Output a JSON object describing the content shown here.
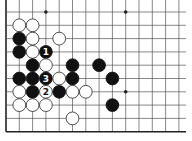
{
  "board": {
    "title": "Go problem diagram",
    "grid": {
      "columns": 14,
      "rows": 10,
      "origin_x": 6,
      "origin_y": 12,
      "spacing": 13.3,
      "left_edge": true,
      "bottom_edge": true,
      "top_edge": false,
      "right_edge": false
    },
    "colors": {
      "background": "#ffffff",
      "line": "#555555",
      "edge": "#222222",
      "black_stone": "#111111",
      "white_stone": "#ffffff",
      "white_stroke": "#222222"
    },
    "hoshi": [
      {
        "col": 3,
        "row": 0
      },
      {
        "col": 9,
        "row": 0
      },
      {
        "col": 9,
        "row": 6
      }
    ],
    "stones": [
      {
        "col": 1,
        "row": 1,
        "color": "white",
        "label": ""
      },
      {
        "col": 2,
        "row": 1,
        "color": "white",
        "label": ""
      },
      {
        "col": 1,
        "row": 2,
        "color": "black",
        "label": ""
      },
      {
        "col": 2,
        "row": 2,
        "color": "white",
        "label": ""
      },
      {
        "col": 4,
        "row": 2,
        "color": "white",
        "label": ""
      },
      {
        "col": 1,
        "row": 3,
        "color": "black",
        "label": ""
      },
      {
        "col": 2,
        "row": 3,
        "color": "white",
        "label": ""
      },
      {
        "col": 3,
        "row": 3,
        "color": "black",
        "label": "1"
      },
      {
        "col": 2,
        "row": 4,
        "color": "black",
        "label": ""
      },
      {
        "col": 3,
        "row": 4,
        "color": "white",
        "label": ""
      },
      {
        "col": 5,
        "row": 4,
        "color": "black",
        "label": ""
      },
      {
        "col": 7,
        "row": 4,
        "color": "black",
        "label": ""
      },
      {
        "col": 1,
        "row": 5,
        "color": "black",
        "label": ""
      },
      {
        "col": 2,
        "row": 5,
        "color": "black",
        "label": ""
      },
      {
        "col": 3,
        "row": 5,
        "color": "black",
        "label": "3"
      },
      {
        "col": 4,
        "row": 5,
        "color": "white",
        "label": ""
      },
      {
        "col": 5,
        "row": 5,
        "color": "black",
        "label": ""
      },
      {
        "col": 8,
        "row": 5,
        "color": "black",
        "label": ""
      },
      {
        "col": 1,
        "row": 6,
        "color": "white",
        "label": ""
      },
      {
        "col": 2,
        "row": 6,
        "color": "black",
        "label": ""
      },
      {
        "col": 3,
        "row": 6,
        "color": "white",
        "label": "2"
      },
      {
        "col": 4,
        "row": 6,
        "color": "black",
        "label": ""
      },
      {
        "col": 5,
        "row": 6,
        "color": "white",
        "label": ""
      },
      {
        "col": 6,
        "row": 6,
        "color": "white",
        "label": ""
      },
      {
        "col": 1,
        "row": 7,
        "color": "white",
        "label": ""
      },
      {
        "col": 2,
        "row": 7,
        "color": "white",
        "label": ""
      },
      {
        "col": 3,
        "row": 7,
        "color": "white",
        "label": ""
      },
      {
        "col": 8,
        "row": 7,
        "color": "black",
        "label": ""
      },
      {
        "col": 5,
        "row": 8,
        "color": "white",
        "label": ""
      }
    ]
  }
}
